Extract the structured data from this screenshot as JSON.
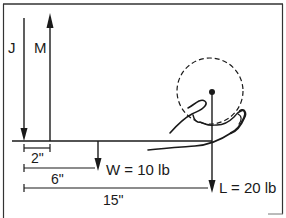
{
  "diagram": {
    "type": "free-body lever diagram (forearm)",
    "forces": {
      "joint": {
        "label": "J",
        "direction": "down"
      },
      "muscle": {
        "label": "M",
        "direction": "up"
      },
      "weight": {
        "label": "W = 10 lb",
        "direction": "down"
      },
      "load": {
        "label": "L = 20 lb",
        "direction": "down"
      }
    },
    "dimensions": [
      {
        "label": "2\""
      },
      {
        "label": "6\""
      },
      {
        "label": "15\""
      }
    ],
    "colors": {
      "line": "#1a1a1a",
      "frame": "#333333",
      "background": "#ffffff"
    }
  }
}
